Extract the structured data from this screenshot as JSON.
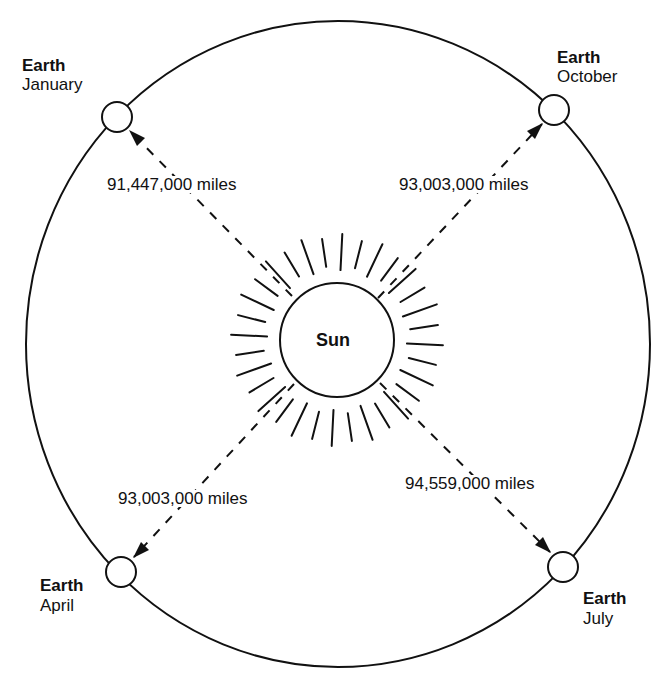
{
  "diagram": {
    "sun": {
      "label": "Sun"
    },
    "positions": [
      {
        "name": "Earth",
        "month": "January",
        "distance": "91,447,000 miles"
      },
      {
        "name": "Earth",
        "month": "October",
        "distance": "93,003,000 miles"
      },
      {
        "name": "Earth",
        "month": "April",
        "distance": "93,003,000 miles"
      },
      {
        "name": "Earth",
        "month": "July",
        "distance": "94,559,000 miles"
      }
    ],
    "colors": {
      "line": "#111111",
      "background": "#ffffff"
    }
  }
}
